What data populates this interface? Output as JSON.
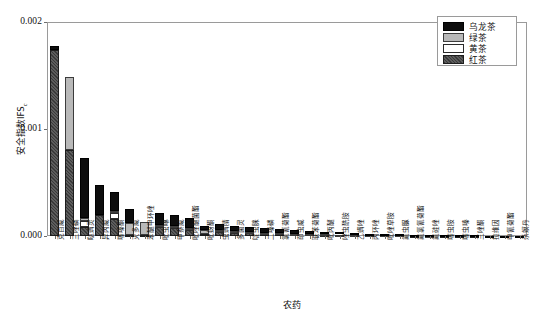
{
  "chart_data": {
    "type": "bar",
    "stacked": true,
    "title": "",
    "xlabel": "农药",
    "ylabel": "安全指数IFSc",
    "ylabel_main": "安全指数IFS",
    "ylabel_sub": "c",
    "ylim": [
      0,
      0.002
    ],
    "ytick_labels": [
      "0.000",
      "0.001",
      "0.002"
    ],
    "ytick_values": [
      0.0,
      0.001,
      0.002
    ],
    "grid": false,
    "legend_position": "top-right",
    "legend": [
      "乌龙茶",
      "绿茶",
      "黄茶",
      "红茶"
    ],
    "series_colors": {
      "乌龙茶": "#0d0d0d",
      "绿茶": "#b9b9b9",
      "黄茶": "#ffffff",
      "红茶": "#4a4a4a"
    },
    "categories": [
      "克百威",
      "三唑磷",
      "哒螨灵",
      "异丙威",
      "噻嗪酮",
      "灭多威",
      "苯醚甲环唑",
      "吡虫啉",
      "甲萘威",
      "吡唑醚菌酯",
      "吡蚜酮",
      "虫螨腈",
      "多菌灵",
      "啶虫脒",
      "二嗪磷",
      "氯氰菊酯",
      "茚虫威",
      "联苯菊酯",
      "吡丙醚",
      "唑虫酰胺",
      "乙螨唑",
      "丙环唑",
      "吡唑草胺",
      "氟虫脲",
      "氟氯氰菊酯",
      "氟硅唑",
      "噻虫胺",
      "噻虫嗪",
      "三唑酮",
      "拉维因",
      "甲氰菊酯",
      "杀螟丹"
    ],
    "series": [
      {
        "name": "乌龙茶",
        "values": [
          4e-05,
          0.0,
          0.00056,
          0.00028,
          0.000175,
          0.000125,
          0.0,
          0.00011,
          0.000105,
          9.5e-05,
          3.5e-05,
          5.5e-05,
          4.8e-05,
          4.5e-05,
          4e-05,
          3.5e-05,
          3e-05,
          2.6e-05,
          2.3e-05,
          2e-05,
          1.7e-05,
          1.4e-05,
          1.2e-05,
          1e-05,
          8e-06,
          7e-06,
          6e-06,
          5e-06,
          4e-06,
          3e-06,
          2e-06,
          1e-06
        ]
      },
      {
        "name": "绿茶",
        "values": [
          0.0,
          0.00069,
          3e-05,
          0.0,
          2e-05,
          0.000115,
          0.00013,
          1e-05,
          6e-06,
          5e-06,
          4.5e-05,
          8e-06,
          5e-06,
          4e-06,
          3e-06,
          3e-06,
          2e-06,
          2e-06,
          2e-06,
          2e-06,
          1e-06,
          1e-06,
          1e-06,
          1e-06,
          1e-06,
          1e-06,
          0.0,
          0.0,
          0.0,
          0.0,
          0.0,
          0.0
        ]
      },
      {
        "name": "黄茶",
        "values": [
          0.0,
          0.0,
          6e-05,
          0.0,
          5.5e-05,
          0.0,
          0.0,
          1.2e-05,
          1e-05,
          8e-06,
          0.0,
          5e-06,
          4e-06,
          3e-06,
          3e-06,
          2e-06,
          2e-06,
          2e-06,
          1e-06,
          1e-06,
          1e-06,
          1e-06,
          1e-06,
          0.0,
          0.0,
          0.0,
          0.0,
          0.0,
          0.0,
          0.0,
          0.0,
          0.0
        ]
      },
      {
        "name": "红茶",
        "values": [
          0.00174,
          0.0008,
          8e-05,
          0.0002,
          0.00016,
          1e-05,
          5e-06,
          8.5e-05,
          7.5e-05,
          6e-05,
          1.5e-05,
          4e-05,
          3.5e-05,
          3e-05,
          2.6e-05,
          2.2e-05,
          1.9e-05,
          1.6e-05,
          1.3e-05,
          1.1e-05,
          9e-06,
          7e-06,
          6e-06,
          5e-06,
          4e-06,
          3e-06,
          3e-06,
          2e-06,
          2e-06,
          1e-06,
          1e-06,
          1e-06
        ]
      }
    ],
    "totals": [
      0.00178,
      0.00149,
      0.00073,
      0.00048,
      0.00041,
      0.00025,
      0.000135,
      0.000217,
      0.000196,
      0.000168,
      9.5e-05,
      0.000108,
      9.2e-05,
      8.2e-05,
      7.2e-05,
      6.2e-05,
      5.3e-05,
      4.6e-05,
      3.9e-05,
      3.4e-05,
      2.8e-05,
      2.3e-05,
      2e-05,
      1.6e-05,
      1.3e-05,
      1.1e-05,
      9e-06,
      7e-06,
      6e-06,
      4e-06,
      3e-06,
      2e-06
    ]
  }
}
